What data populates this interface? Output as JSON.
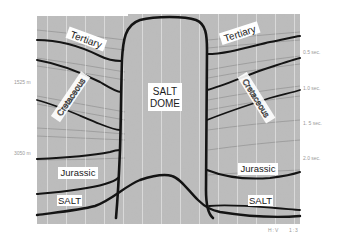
{
  "figure": {
    "background": "#ffffff",
    "seismic_colors": {
      "light": "#d8d8d8",
      "mid": "#8a8a8a",
      "dark": "#2a2a2a",
      "horizon": "#141414",
      "label_bg": "#ffffff"
    }
  },
  "labels": {
    "tertiary_left": "Tertiary",
    "tertiary_right": "Tertiary",
    "cretaceous_left": "Cretaceous",
    "cretaceous_right": "Cretaceous",
    "salt_dome_line1": "SALT",
    "salt_dome_line2": "DOME",
    "jurassic_left": "Jurassic",
    "jurassic_right": "Jurassic",
    "salt_left": "SALT",
    "salt_right": "SALT"
  },
  "depth_axis": {
    "ticks": [
      {
        "label": "1525 m",
        "y": 82
      },
      {
        "label": "3050 m",
        "y": 153
      }
    ]
  },
  "time_axis": {
    "ticks": [
      {
        "label": "0.5 sec.",
        "y": 52
      },
      {
        "label": "1.0 sec.",
        "y": 88
      },
      {
        "label": "1. 5 sec.",
        "y": 123
      },
      {
        "label": "2.0 sec.",
        "y": 158
      }
    ]
  },
  "scale_note": {
    "label": "H:V    1:3"
  }
}
